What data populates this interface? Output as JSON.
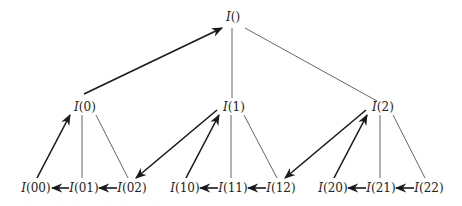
{
  "diagram": {
    "type": "tree-traversal",
    "nodes": {
      "root": {
        "fn": "I",
        "arg": "",
        "label": "I()"
      },
      "n0": {
        "fn": "I",
        "arg": "0",
        "label": "I(0)"
      },
      "n1": {
        "fn": "I",
        "arg": "1",
        "label": "I(1)"
      },
      "n2": {
        "fn": "I",
        "arg": "2",
        "label": "I(2)"
      },
      "n00": {
        "fn": "I",
        "arg": "00",
        "label": "I(00)"
      },
      "n01": {
        "fn": "I",
        "arg": "01",
        "label": "I(01)"
      },
      "n02": {
        "fn": "I",
        "arg": "02",
        "label": "I(02)"
      },
      "n10": {
        "fn": "I",
        "arg": "10",
        "label": "I(10)"
      },
      "n11": {
        "fn": "I",
        "arg": "11",
        "label": "I(11)"
      },
      "n12": {
        "fn": "I",
        "arg": "12",
        "label": "I(12)"
      },
      "n20": {
        "fn": "I",
        "arg": "20",
        "label": "I(20)"
      },
      "n21": {
        "fn": "I",
        "arg": "21",
        "label": "I(21)"
      },
      "n22": {
        "fn": "I",
        "arg": "22",
        "label": "I(22)"
      }
    },
    "tree_edges": [
      [
        "root",
        "n1"
      ],
      [
        "root",
        "n2"
      ],
      [
        "n0",
        "n01"
      ],
      [
        "n0",
        "n02"
      ],
      [
        "n1",
        "n11"
      ],
      [
        "n1",
        "n12"
      ],
      [
        "n2",
        "n21"
      ],
      [
        "n2",
        "n22"
      ]
    ],
    "traversal_arrows": [
      [
        "n00",
        "n0"
      ],
      [
        "n0",
        "root"
      ],
      [
        "n01",
        "n00"
      ],
      [
        "n02",
        "n01"
      ],
      [
        "n1",
        "n02"
      ],
      [
        "n10",
        "n1"
      ],
      [
        "n11",
        "n10"
      ],
      [
        "n12",
        "n11"
      ],
      [
        "n2",
        "n12"
      ],
      [
        "n20",
        "n2"
      ],
      [
        "n21",
        "n20"
      ],
      [
        "n22",
        "n21"
      ]
    ]
  }
}
